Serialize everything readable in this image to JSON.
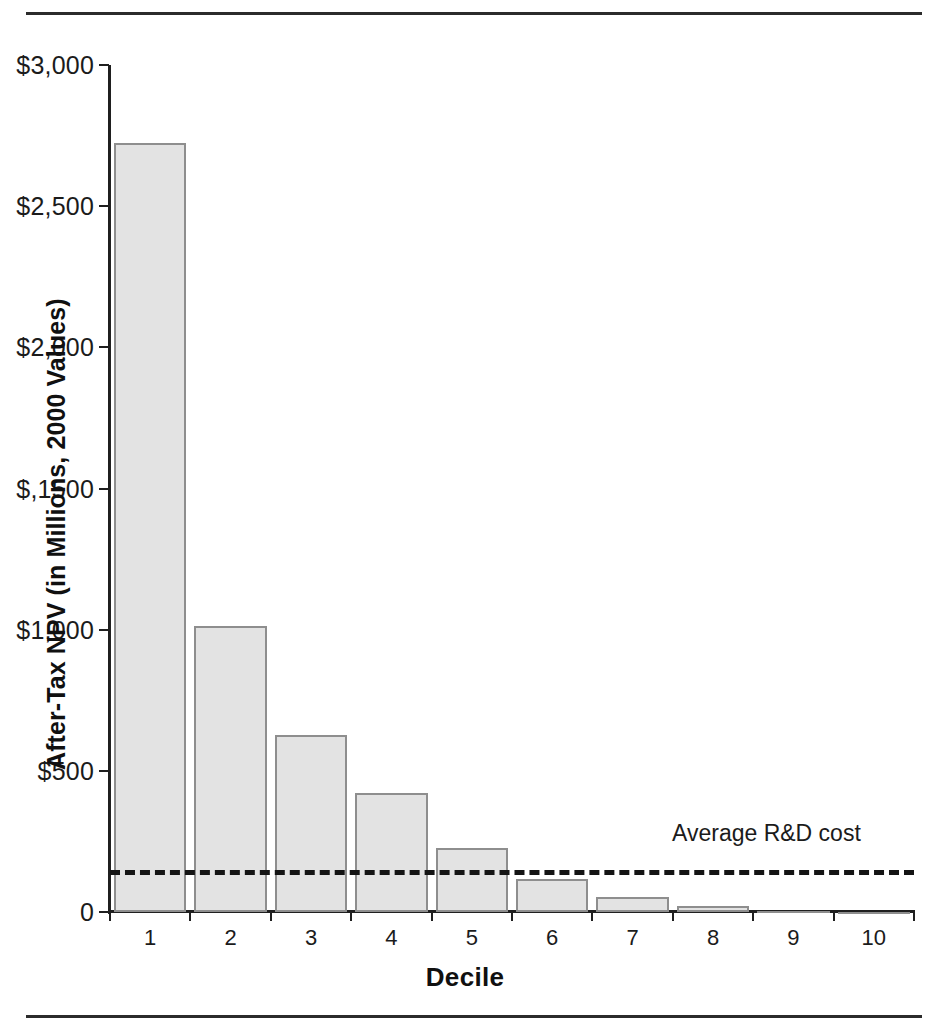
{
  "figure": {
    "background_color": "#ffffff",
    "rule_color": "#2b2b2b",
    "bar_fill_color": "#e3e3e3",
    "bar_stroke_color": "#8e8e8e",
    "axis_color": "#1f1f1f",
    "refline_color": "#141414"
  },
  "chart_data": {
    "type": "bar",
    "title": "",
    "subtitle": "",
    "xlabel": "Decile",
    "ylabel": "After-Tax NPV (in Millions, 2000 Values)",
    "categories": [
      "1",
      "2",
      "3",
      "4",
      "5",
      "6",
      "7",
      "8",
      "9",
      "10"
    ],
    "values": [
      2724,
      1013,
      627,
      422,
      227,
      117,
      53,
      21,
      3,
      0
    ],
    "ylim": [
      0,
      3000
    ],
    "xlim_categories": 10,
    "ytick_values": [
      0,
      500,
      1000,
      1500,
      2000,
      2500,
      3000
    ],
    "ytick_labels": [
      "0",
      "$500",
      "$1,000",
      "$,1500",
      "$2,000",
      "$2,500",
      "$3,000"
    ],
    "xtick_labels": [
      "1",
      "2",
      "3",
      "4",
      "5",
      "6",
      "7",
      "8",
      "9",
      "10"
    ],
    "grid": false,
    "legend": false,
    "legend_position": "none",
    "annotations": [
      {
        "name": "average-rd-cost",
        "label": "Average R&D cost",
        "type": "horizontal-reference-line",
        "value": 150,
        "style": "dashed"
      }
    ]
  }
}
